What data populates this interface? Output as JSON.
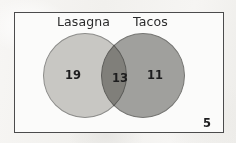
{
  "figure": {
    "type": "venn-diagram",
    "sets": [
      {
        "id": "lasagna",
        "label": "Lasagna",
        "fill": "#cbcac7",
        "stroke": "#8f8f8d"
      },
      {
        "id": "tacos",
        "label": "Tacos",
        "fill": "#a3a3a0",
        "stroke": "#777775"
      }
    ],
    "regions": [
      {
        "id": "lasagna-only",
        "value": "19"
      },
      {
        "id": "both",
        "value": "13"
      },
      {
        "id": "tacos-only",
        "value": "11"
      },
      {
        "id": "neither",
        "value": "5"
      }
    ],
    "box": {
      "stroke": "#4b4b4c",
      "fill": "#fbfbfa"
    }
  },
  "chart_data": {
    "type": "venn",
    "title": "",
    "categories": [
      "Lasagna only",
      "Both",
      "Tacos only",
      "Neither"
    ],
    "values": [
      19,
      13,
      11,
      5
    ],
    "series": [
      {
        "name": "Lasagna",
        "total": 32
      },
      {
        "name": "Tacos",
        "total": 24
      }
    ],
    "set_labels": [
      "Lasagna",
      "Tacos"
    ],
    "intersection": 13,
    "outside": 5,
    "universe_total": 48,
    "legend": "none",
    "grid": false,
    "xlabel": "",
    "ylabel": ""
  }
}
